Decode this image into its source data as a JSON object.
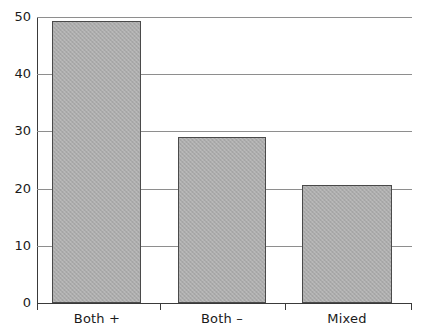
{
  "chart_data": {
    "type": "bar",
    "title": "",
    "subtitle": "",
    "xlabel": "",
    "ylabel": "",
    "categories": [
      "Both +",
      "Both –",
      "Mixed"
    ],
    "values": [
      49.3,
      29.0,
      20.6
    ],
    "series": [
      {
        "name": "",
        "values": [
          49.3,
          29.0,
          20.6
        ]
      }
    ],
    "ylim": [
      0,
      50
    ],
    "yticks": [
      0,
      10,
      20,
      30,
      40,
      50
    ],
    "ytick_labels": [
      "0",
      "10",
      "20",
      "30",
      "40",
      "50"
    ],
    "grid": true,
    "grid_axis": "y",
    "legend": false,
    "legend_position": "none",
    "bar_fill_color": "#ababab",
    "bar_edge_color": "#4a4a4a",
    "grid_color": "#8e8e8e",
    "axis_color": "#3a3a3a",
    "background_color": "#ffffff"
  },
  "axes": {
    "y": {
      "ticks": [
        {
          "value": 50,
          "label": "50"
        },
        {
          "value": 40,
          "label": "40"
        },
        {
          "value": 30,
          "label": "30"
        },
        {
          "value": 20,
          "label": "20"
        },
        {
          "value": 10,
          "label": "10"
        },
        {
          "value": 0,
          "label": "0"
        }
      ]
    },
    "x": {
      "ticks": [
        {
          "label": "Both +"
        },
        {
          "label": "Both –"
        },
        {
          "label": "Mixed"
        }
      ]
    }
  }
}
